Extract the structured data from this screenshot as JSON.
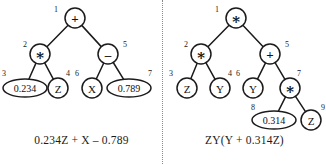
{
  "figure": {
    "type": "expression-trees",
    "divider": "vertical-dotted-line",
    "panels": [
      {
        "id": "left",
        "caption": "0.234Z + X – 0.789",
        "expression": "0.234Z + X - 0.789",
        "nodes": [
          {
            "id": "1",
            "label": "+",
            "kind": "operator",
            "shape": "circle",
            "cx": 75,
            "cy": 18,
            "r": 10,
            "id_x": 56,
            "id_y": 9
          },
          {
            "id": "2",
            "label": "∗",
            "kind": "operator",
            "shape": "circle",
            "cx": 40,
            "cy": 54,
            "r": 10,
            "id_x": 25,
            "id_y": 44
          },
          {
            "id": "5",
            "label": "–",
            "kind": "operator",
            "shape": "circle",
            "cx": 108,
            "cy": 54,
            "r": 10,
            "id_x": 125,
            "id_y": 44
          },
          {
            "id": "3",
            "label": "0.234",
            "kind": "constant",
            "shape": "ellipse",
            "cx": 25,
            "cy": 88,
            "rx": 22,
            "ry": 9,
            "id_x": 4,
            "id_y": 73
          },
          {
            "id": "4",
            "label": "Z",
            "kind": "variable",
            "shape": "circle",
            "cx": 58,
            "cy": 88,
            "r": 10,
            "id_x": 68,
            "id_y": 73
          },
          {
            "id": "6",
            "label": "X",
            "kind": "variable",
            "shape": "circle",
            "cx": 92,
            "cy": 88,
            "r": 10,
            "id_x": 77,
            "id_y": 73
          },
          {
            "id": "7",
            "label": "0.789",
            "kind": "constant",
            "shape": "ellipse",
            "cx": 129,
            "cy": 88,
            "rx": 22,
            "ry": 9,
            "id_x": 150,
            "id_y": 73
          }
        ],
        "edges": [
          {
            "from": "1",
            "to": "2"
          },
          {
            "from": "1",
            "to": "5"
          },
          {
            "from": "2",
            "to": "3"
          },
          {
            "from": "2",
            "to": "4"
          },
          {
            "from": "5",
            "to": "6"
          },
          {
            "from": "5",
            "to": "7"
          }
        ]
      },
      {
        "id": "right",
        "caption": "ZY(Y + 0.314Z)",
        "expression": "ZY(Y + 0.314Z)",
        "nodes": [
          {
            "id": "1",
            "label": "∗",
            "kind": "operator",
            "shape": "circle",
            "cx": 73,
            "cy": 18,
            "r": 10,
            "id_x": 54,
            "id_y": 9
          },
          {
            "id": "2",
            "label": "∗",
            "kind": "operator",
            "shape": "circle",
            "cx": 38,
            "cy": 54,
            "r": 10,
            "id_x": 23,
            "id_y": 44
          },
          {
            "id": "5",
            "label": "+",
            "kind": "operator",
            "shape": "circle",
            "cx": 107,
            "cy": 54,
            "r": 10,
            "id_x": 124,
            "id_y": 44
          },
          {
            "id": "3",
            "label": "Z",
            "kind": "variable",
            "shape": "circle",
            "cx": 24,
            "cy": 88,
            "r": 10,
            "id_x": 8,
            "id_y": 73
          },
          {
            "id": "4",
            "label": "Y",
            "kind": "variable",
            "shape": "circle",
            "cx": 57,
            "cy": 88,
            "r": 10,
            "id_x": 67,
            "id_y": 73
          },
          {
            "id": "6",
            "label": "Y",
            "kind": "variable",
            "shape": "circle",
            "cx": 90,
            "cy": 88,
            "r": 10,
            "id_x": 75,
            "id_y": 73
          },
          {
            "id": "7",
            "label": "∗",
            "kind": "operator",
            "shape": "circle",
            "cx": 127,
            "cy": 88,
            "r": 10,
            "id_x": 136,
            "id_y": 73
          },
          {
            "id": "8",
            "label": "0.314",
            "kind": "constant",
            "shape": "ellipse",
            "cx": 111,
            "cy": 120,
            "rx": 22,
            "ry": 9,
            "id_x": 90,
            "id_y": 107
          },
          {
            "id": "9",
            "label": "Z",
            "kind": "variable",
            "shape": "circle",
            "cx": 148,
            "cy": 120,
            "r": 10,
            "id_x": 160,
            "id_y": 107
          }
        ],
        "edges": [
          {
            "from": "1",
            "to": "2"
          },
          {
            "from": "1",
            "to": "5"
          },
          {
            "from": "2",
            "to": "3"
          },
          {
            "from": "2",
            "to": "4"
          },
          {
            "from": "5",
            "to": "6"
          },
          {
            "from": "5",
            "to": "7"
          },
          {
            "from": "7",
            "to": "8"
          },
          {
            "from": "7",
            "to": "9"
          }
        ]
      }
    ]
  },
  "colors": {
    "ink": "#1b1b1b",
    "paper": "#ffffff",
    "divider": "#8a8a8a"
  }
}
